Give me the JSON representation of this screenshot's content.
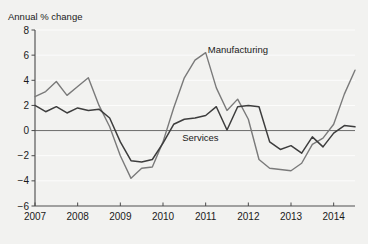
{
  "chart_data": {
    "type": "line",
    "title": "",
    "ylabel": "Annual % change",
    "xlabel": "",
    "ylim": [
      -6,
      8
    ],
    "xlim": [
      2007,
      2014.5
    ],
    "yticks": [
      8,
      6,
      4,
      2,
      0,
      -2,
      -4,
      -6
    ],
    "ytick_labels": [
      "8",
      "6",
      "4",
      "2",
      "0",
      "−2",
      "−4",
      "−6"
    ],
    "xticks": [
      2007,
      2008,
      2009,
      2010,
      2011,
      2012,
      2013,
      2014
    ],
    "xtick_labels": [
      "2007",
      "2008",
      "2009",
      "2010",
      "2011",
      "2012",
      "2013",
      "2014"
    ],
    "grid": true,
    "legend_position": "inline-annotations",
    "zero_line": 0,
    "series": [
      {
        "name": "Manufacturing",
        "color": "#7a7a7a",
        "label_x": 2011.05,
        "label_y": 6.2,
        "x": [
          2007.0,
          2007.25,
          2007.5,
          2007.75,
          2008.0,
          2008.25,
          2008.5,
          2008.75,
          2009.0,
          2009.25,
          2009.5,
          2009.75,
          2010.0,
          2010.25,
          2010.5,
          2010.75,
          2011.0,
          2011.25,
          2011.5,
          2011.75,
          2012.0,
          2012.25,
          2012.5,
          2012.75,
          2013.0,
          2013.25,
          2013.5,
          2013.75,
          2014.0,
          2014.25,
          2014.5
        ],
        "values": [
          2.7,
          3.1,
          3.9,
          2.8,
          3.5,
          4.2,
          2.0,
          0.3,
          -2.0,
          -3.8,
          -3.0,
          -2.9,
          -0.9,
          1.8,
          4.2,
          5.6,
          6.2,
          3.4,
          1.6,
          2.5,
          0.9,
          -2.3,
          -3.0,
          -3.1,
          -3.2,
          -2.6,
          -1.1,
          -0.6,
          0.5,
          2.9,
          4.8
        ]
      },
      {
        "name": "Services",
        "color": "#3d3d3d",
        "label_x": 2010.45,
        "label_y": -0.85,
        "x": [
          2007.0,
          2007.25,
          2007.5,
          2007.75,
          2008.0,
          2008.25,
          2008.5,
          2008.75,
          2009.0,
          2009.25,
          2009.5,
          2009.75,
          2010.0,
          2010.25,
          2010.5,
          2010.75,
          2011.0,
          2011.25,
          2011.5,
          2011.75,
          2012.0,
          2012.25,
          2012.5,
          2012.75,
          2013.0,
          2013.25,
          2013.5,
          2013.75,
          2014.0,
          2014.25,
          2014.5
        ],
        "values": [
          2.0,
          1.5,
          1.9,
          1.4,
          1.8,
          1.6,
          1.7,
          1.0,
          -0.9,
          -2.4,
          -2.5,
          -2.3,
          -1.0,
          0.5,
          0.9,
          1.0,
          1.2,
          1.9,
          0.05,
          1.9,
          2.0,
          1.9,
          -0.9,
          -1.5,
          -1.2,
          -1.8,
          -0.5,
          -1.3,
          -0.2,
          0.4,
          0.3
        ]
      }
    ]
  },
  "plot": {
    "background": "#f2f2f0",
    "axis_color": "#4a4a4a",
    "grid_color": "#ffffff"
  }
}
